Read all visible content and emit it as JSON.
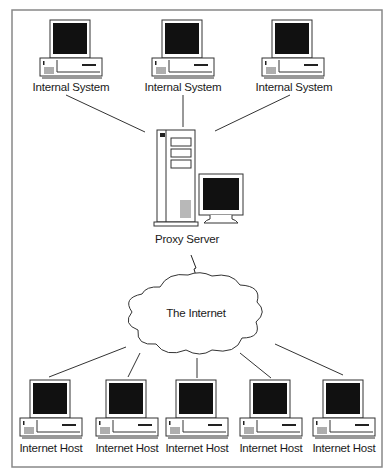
{
  "diagram": {
    "colors": {
      "line": "#333333",
      "screen": "#111111",
      "frame": "#888888",
      "background": "#ffffff"
    },
    "internal_systems": [
      {
        "label": "Internal System",
        "x": 30,
        "y": 18
      },
      {
        "label": "Internal System",
        "x": 152,
        "y": 18
      },
      {
        "label": "Internal System",
        "x": 262,
        "y": 18
      }
    ],
    "proxy": {
      "label": "Proxy Server"
    },
    "cloud": {
      "label": "The Internet"
    },
    "internet_hosts": [
      {
        "label": "Internet Host",
        "x": 20,
        "y": 380
      },
      {
        "label": "Internet Host",
        "x": 96,
        "y": 380
      },
      {
        "label": "Internet Host",
        "x": 166,
        "y": 380
      },
      {
        "label": "Internet Host",
        "x": 240,
        "y": 380
      },
      {
        "label": "Internet Host",
        "x": 313,
        "y": 380
      }
    ]
  }
}
